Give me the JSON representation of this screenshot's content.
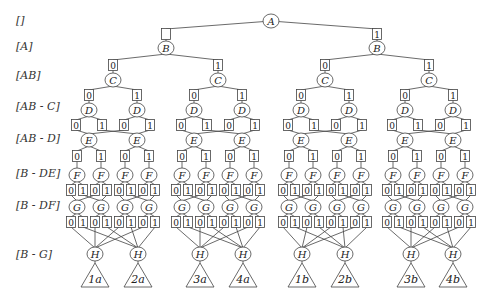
{
  "row_labels": [
    {
      "text": "[]",
      "y": 22
    },
    {
      "text": "[A]",
      "y": 48
    },
    {
      "text": "[AB]",
      "y": 77
    },
    {
      "text": "[AB - C]",
      "y": 108
    },
    {
      "text": "[AB - D]",
      "y": 140
    },
    {
      "text": "[B - DE]",
      "y": 175
    },
    {
      "text": "[B - DF]",
      "y": 207
    },
    {
      "text": "[B - G]",
      "y": 256
    }
  ],
  "root": {
    "label": "A",
    "x": 271,
    "y": 21
  },
  "level_B": {
    "label": "B",
    "y": 48,
    "box_y": 34,
    "nodes": [
      {
        "x": 166,
        "box": ""
      },
      {
        "x": 377,
        "box": "1"
      }
    ]
  },
  "level_C": {
    "label": "C",
    "y": 80,
    "box_y": 65,
    "nodes": [
      {
        "x": 113,
        "box": "0"
      },
      {
        "x": 218,
        "box": "1"
      },
      {
        "x": 325,
        "box": "0"
      },
      {
        "x": 429,
        "box": "1"
      }
    ]
  },
  "level_D": {
    "label": "D",
    "y": 110,
    "box_y": 95,
    "nodes": [
      {
        "x": 89,
        "box": "0"
      },
      {
        "x": 137,
        "box": "1"
      },
      {
        "x": 194,
        "box": "0"
      },
      {
        "x": 242,
        "box": "1"
      },
      {
        "x": 301,
        "box": "0"
      },
      {
        "x": 349,
        "box": "1"
      },
      {
        "x": 405,
        "box": "0"
      },
      {
        "x": 453,
        "box": "1"
      }
    ]
  },
  "level_D_children": {
    "box_y": 125,
    "offset": 13,
    "labels": [
      "0",
      "1"
    ]
  },
  "level_E": {
    "label": "E",
    "y": 140,
    "nodes": [
      {
        "x": 89
      },
      {
        "x": 137
      },
      {
        "x": 194
      },
      {
        "x": 242
      },
      {
        "x": 301
      },
      {
        "x": 349
      },
      {
        "x": 405
      },
      {
        "x": 453
      }
    ]
  },
  "level_E_children": {
    "box_y": 156,
    "offset": 12,
    "labels": [
      "0",
      "1"
    ]
  },
  "level_F": {
    "label": "F",
    "y": 175,
    "nodes": [
      {
        "x": 77
      },
      {
        "x": 101
      },
      {
        "x": 125
      },
      {
        "x": 149
      },
      {
        "x": 182
      },
      {
        "x": 206
      },
      {
        "x": 230
      },
      {
        "x": 254
      },
      {
        "x": 289
      },
      {
        "x": 313
      },
      {
        "x": 337
      },
      {
        "x": 361
      },
      {
        "x": 393
      },
      {
        "x": 417
      },
      {
        "x": 441
      },
      {
        "x": 465
      }
    ]
  },
  "level_F_children": {
    "box_y": 190,
    "offset": 6,
    "labels": [
      "0",
      "1"
    ]
  },
  "level_G": {
    "label": "G",
    "y": 207,
    "nodes": [
      {
        "x": 77
      },
      {
        "x": 101
      },
      {
        "x": 125
      },
      {
        "x": 149
      },
      {
        "x": 182
      },
      {
        "x": 206
      },
      {
        "x": 230
      },
      {
        "x": 254
      },
      {
        "x": 289
      },
      {
        "x": 313
      },
      {
        "x": 337
      },
      {
        "x": 361
      },
      {
        "x": 393
      },
      {
        "x": 417
      },
      {
        "x": 441
      },
      {
        "x": 465
      }
    ]
  },
  "level_G_children": {
    "box_y": 222,
    "offset": 6,
    "labels": [
      "0",
      "1"
    ]
  },
  "level_H": {
    "label": "H",
    "y": 254,
    "nodes": [
      {
        "x": 95
      },
      {
        "x": 138
      },
      {
        "x": 200
      },
      {
        "x": 243
      },
      {
        "x": 302
      },
      {
        "x": 345
      },
      {
        "x": 411
      },
      {
        "x": 453
      }
    ]
  },
  "leaves": {
    "top_y": 263,
    "bottom_y": 287,
    "half_width": 14,
    "items": [
      {
        "label": "1a"
      },
      {
        "label": "2a"
      },
      {
        "label": "3a"
      },
      {
        "label": "4a"
      },
      {
        "label": "1b"
      },
      {
        "label": "2b"
      },
      {
        "label": "3b"
      },
      {
        "label": "4b"
      }
    ]
  },
  "colors": {
    "stroke": "#444444",
    "text": "#222222",
    "background": "#ffffff"
  }
}
